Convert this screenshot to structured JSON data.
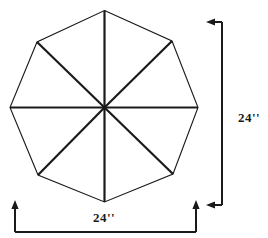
{
  "figure": {
    "shape": {
      "name": "regular-octagon",
      "sides": 8,
      "spokes": 8,
      "stroke_color": "#1a1a1a",
      "fill_color": "none",
      "outline_stroke_width": 1.1,
      "spoke_stroke_width": 2.2,
      "center": {
        "x": 104.5,
        "y": 107.5
      },
      "vertices": [
        {
          "id": "top",
          "x": 104.5,
          "y": 10.5
        },
        {
          "id": "upper-right",
          "x": 172.0,
          "y": 41.0
        },
        {
          "id": "right",
          "x": 198.0,
          "y": 107.5
        },
        {
          "id": "lower-right",
          "x": 173.0,
          "y": 174.0
        },
        {
          "id": "bottom",
          "x": 104.5,
          "y": 202.0
        },
        {
          "id": "lower-left",
          "x": 38.0,
          "y": 175.0
        },
        {
          "id": "left",
          "x": 10.0,
          "y": 107.5
        },
        {
          "id": "upper-left",
          "x": 37.0,
          "y": 42.0
        }
      ]
    },
    "dimensions": [
      {
        "id": "vertical-dimension",
        "label": "24''",
        "value": 24,
        "unit": "inches",
        "orientation": "vertical",
        "label_position": {
          "x": 249,
          "y": 119
        },
        "line_color": "#1a1a1a",
        "extent": {
          "top_y": 22,
          "bottom_y": 205,
          "line_x": 222
        },
        "arrow_top": {
          "x": 206,
          "y": 22,
          "direction": "left"
        },
        "arrow_bottom": {
          "x": 206,
          "y": 205,
          "direction": "left"
        }
      },
      {
        "id": "horizontal-dimension",
        "label": "24''",
        "value": 24,
        "unit": "inches",
        "orientation": "horizontal",
        "label_position": {
          "x": 104,
          "y": 219
        },
        "line_color": "#1a1a1a",
        "extent": {
          "left_x": 15,
          "right_x": 196,
          "line_y": 232
        },
        "arrow_left": {
          "x": 15,
          "y": 200,
          "direction": "up"
        },
        "arrow_right": {
          "x": 196,
          "y": 200,
          "direction": "up"
        }
      }
    ]
  }
}
